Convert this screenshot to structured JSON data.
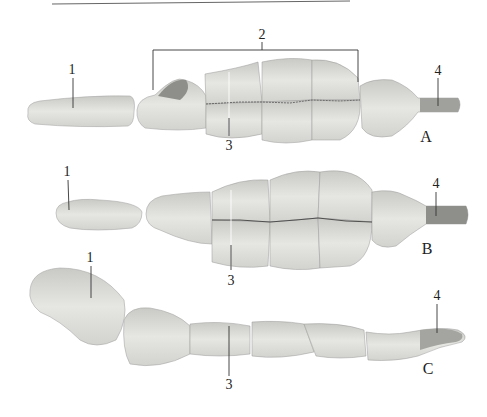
{
  "figure": {
    "panels": [
      {
        "id": "A",
        "label": "A",
        "label_pos": [
          426,
          137
        ],
        "callouts": [
          {
            "text": "1",
            "pos": [
              72,
              70
            ]
          },
          {
            "text": "2",
            "pos": [
              262,
              35
            ]
          },
          {
            "text": "3",
            "pos": [
              229,
              146
            ]
          },
          {
            "text": "4",
            "pos": [
              438,
              71
            ]
          }
        ]
      },
      {
        "id": "B",
        "label": "B",
        "label_pos": [
          427,
          249
        ],
        "callouts": [
          {
            "text": "1",
            "pos": [
              67,
              172
            ]
          },
          {
            "text": "3",
            "pos": [
              231,
              281
            ]
          },
          {
            "text": "4",
            "pos": [
              436,
              184
            ]
          }
        ]
      },
      {
        "id": "C",
        "label": "C",
        "label_pos": [
          428,
          369
        ],
        "callouts": [
          {
            "text": "1",
            "pos": [
              90,
              258
            ]
          },
          {
            "text": "3",
            "pos": [
              229,
              385
            ]
          },
          {
            "text": "4",
            "pos": [
              437,
              296
            ]
          }
        ]
      }
    ],
    "colors": {
      "bone_light": "#e4e4e0",
      "bone_mid": "#cfcfcb",
      "bone_dark": "#a8a8a4",
      "line": "#333333"
    }
  }
}
